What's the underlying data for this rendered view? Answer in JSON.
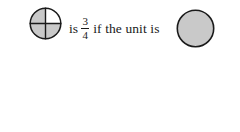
{
  "page": {
    "background_color": "#ffffff",
    "width": 240,
    "height": 132
  },
  "style": {
    "shaded_fill": "#c9c9c9",
    "unshaded_fill": "#ffffff",
    "outline_color": "#1a1a1a",
    "text_color": "#1a1a1a"
  },
  "rows": [
    {
      "id": "row-1",
      "part_figure": {
        "shape": "circle",
        "divisions": 4,
        "shaded_parts": 3,
        "shaded_quadrants": [
          "top-left",
          "bottom-left",
          "bottom-right"
        ],
        "unshaded_quadrants": [
          "top-right"
        ],
        "diameter": 31
      },
      "sentence": {
        "lead": "is",
        "fraction": {
          "numerator": "3",
          "denominator": "4"
        },
        "tail": "if the unit is"
      },
      "unit_figure": {
        "shape": "circle",
        "count": 1,
        "shaded": true,
        "diameter": 37
      }
    },
    {
      "id": "row-2",
      "part_figure": {
        "shape": "circle",
        "divisions": 4,
        "shaded_parts": 3,
        "shaded_quadrants": [
          "top-left",
          "bottom-left",
          "bottom-right"
        ],
        "unshaded_quadrants": [
          "top-right"
        ],
        "diameter": 37
      },
      "sentence": {
        "lead": "is",
        "fraction": {
          "numerator": "3",
          "denominator": "8"
        },
        "tail": "if the unit is"
      },
      "unit_figure": {
        "shape": "circle",
        "count": 2,
        "shaded": true,
        "diameter": 37
      }
    }
  ]
}
